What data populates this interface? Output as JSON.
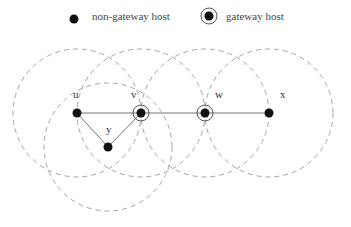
{
  "legend": {
    "non_gateway_label": "non-gateway host",
    "gateway_label": "gateway host"
  },
  "nodes": [
    {
      "id": "u",
      "label": "u",
      "x": 77,
      "y": 113,
      "gateway": false
    },
    {
      "id": "v",
      "label": "v",
      "x": 141,
      "y": 113,
      "gateway": true
    },
    {
      "id": "y",
      "label": "y",
      "x": 108,
      "y": 147,
      "gateway": false
    },
    {
      "id": "w",
      "label": "w",
      "x": 205,
      "y": 113,
      "gateway": true
    },
    {
      "id": "x",
      "label": "x",
      "x": 269,
      "y": 113,
      "gateway": false
    }
  ],
  "edges": [
    [
      "u",
      "v"
    ],
    [
      "u",
      "y"
    ],
    [
      "y",
      "v"
    ],
    [
      "v",
      "w"
    ],
    [
      "w",
      "x"
    ]
  ],
  "range_radius": 64,
  "colors": {
    "node": "#111111",
    "edge": "#777777",
    "range": "#999999"
  }
}
